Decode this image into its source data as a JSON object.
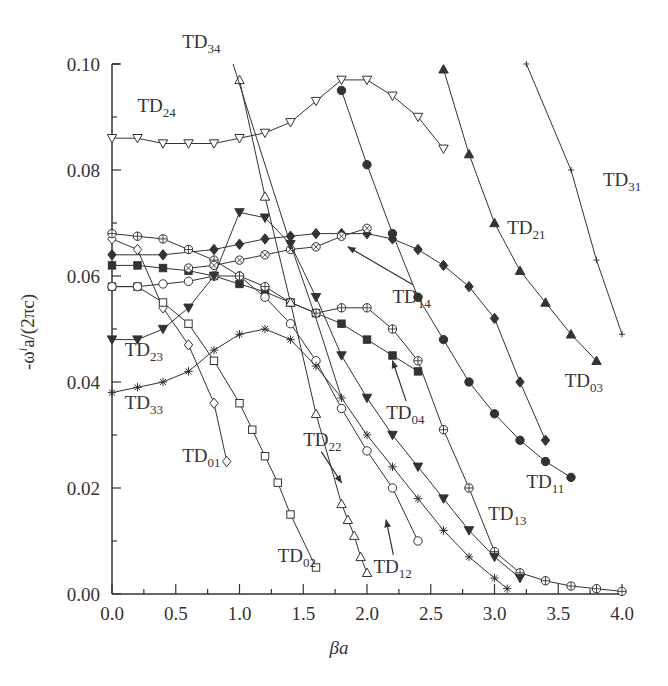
{
  "chart_data": {
    "type": "line",
    "title": "",
    "xlabel": "βa",
    "ylabel": "-ω^i a/(2πc)",
    "xlim": [
      0.0,
      4.0
    ],
    "ylim": [
      0.0,
      0.1
    ],
    "x_ticks": [
      "0.0",
      "0.5",
      "1.0",
      "1.5",
      "2.0",
      "2.5",
      "3.0",
      "3.5",
      "4.0"
    ],
    "y_ticks": [
      "0.00",
      "0.02",
      "0.04",
      "0.06",
      "0.08",
      "0.10"
    ],
    "grid": false,
    "legend": "inline labels",
    "series": [
      {
        "name": "TD01",
        "marker": "diamond-open",
        "x": [
          0.0,
          0.2,
          0.4,
          0.6,
          0.8,
          0.9
        ],
        "y": [
          0.067,
          0.065,
          0.054,
          0.047,
          0.036,
          0.025
        ]
      },
      {
        "name": "TD02",
        "marker": "square-open",
        "x": [
          0.0,
          0.2,
          0.4,
          0.6,
          0.8,
          1.0,
          1.1,
          1.2,
          1.3,
          1.4,
          1.6
        ],
        "y": [
          0.058,
          0.058,
          0.055,
          0.051,
          0.044,
          0.036,
          0.031,
          0.026,
          0.021,
          0.015,
          0.005
        ]
      },
      {
        "name": "TD03",
        "marker": "diamond-filled",
        "x": [
          0.0,
          0.4,
          0.8,
          1.0,
          1.2,
          1.4,
          1.6,
          1.8,
          2.0,
          2.2,
          2.4,
          2.6,
          2.8,
          3.0,
          3.2,
          3.4
        ],
        "y": [
          0.064,
          0.064,
          0.065,
          0.066,
          0.067,
          0.0675,
          0.068,
          0.068,
          0.068,
          0.067,
          0.065,
          0.062,
          0.058,
          0.052,
          0.04,
          0.029
        ]
      },
      {
        "name": "TD04",
        "marker": "square-filled",
        "x": [
          0.0,
          0.2,
          0.4,
          0.6,
          0.8,
          1.0,
          1.2,
          1.4,
          1.6,
          1.8,
          2.0,
          2.2,
          2.4
        ],
        "y": [
          0.062,
          0.062,
          0.0615,
          0.061,
          0.06,
          0.0585,
          0.057,
          0.055,
          0.053,
          0.051,
          0.048,
          0.045,
          0.042
        ]
      },
      {
        "name": "TD11",
        "marker": "circle-filled",
        "x": [
          1.8,
          2.0,
          2.2,
          2.4,
          2.6,
          2.8,
          3.0,
          3.2,
          3.4,
          3.6
        ],
        "y": [
          0.095,
          0.081,
          0.068,
          0.056,
          0.048,
          0.04,
          0.034,
          0.029,
          0.025,
          0.022
        ]
      },
      {
        "name": "TD12",
        "marker": "circle-open",
        "x": [
          0.0,
          0.2,
          0.4,
          0.6,
          0.8,
          1.0,
          1.2,
          1.4,
          1.6,
          1.8,
          2.0,
          2.2,
          2.4
        ],
        "y": [
          0.058,
          0.058,
          0.0585,
          0.059,
          0.06,
          0.06,
          0.056,
          0.051,
          0.044,
          0.035,
          0.027,
          0.02,
          0.01
        ]
      },
      {
        "name": "TD13",
        "marker": "circle-plus",
        "x": [
          0.0,
          0.2,
          0.4,
          0.6,
          0.8,
          1.0,
          1.2,
          1.4,
          1.6,
          1.8,
          2.0,
          2.2,
          2.4,
          2.6,
          2.8,
          3.0,
          3.2,
          3.4,
          3.6,
          3.8,
          4.0
        ],
        "y": [
          0.068,
          0.0675,
          0.067,
          0.065,
          0.063,
          0.06,
          0.058,
          0.055,
          0.053,
          0.054,
          0.054,
          0.05,
          0.044,
          0.031,
          0.02,
          0.008,
          0.004,
          0.0025,
          0.0015,
          0.001,
          0.0005
        ]
      },
      {
        "name": "TD14",
        "marker": "circle-cross",
        "x": [
          0.6,
          0.8,
          1.0,
          1.2,
          1.4,
          1.6,
          1.8,
          2.0
        ],
        "y": [
          0.0615,
          0.062,
          0.063,
          0.064,
          0.065,
          0.0655,
          0.0675,
          0.069
        ]
      },
      {
        "name": "TD21",
        "marker": "triangle-up-filled",
        "x": [
          2.6,
          2.8,
          3.0,
          3.2,
          3.4,
          3.6,
          3.8
        ],
        "y": [
          0.099,
          0.083,
          0.07,
          0.061,
          0.055,
          0.049,
          0.044
        ]
      },
      {
        "name": "TD22",
        "marker": "triangle-up-open",
        "x": [
          1.0,
          1.2,
          1.4,
          1.6,
          1.8,
          1.85,
          1.9,
          1.95,
          2.0
        ],
        "y": [
          0.097,
          0.075,
          0.055,
          0.034,
          0.017,
          0.014,
          0.011,
          0.007,
          0.004
        ]
      },
      {
        "name": "TD23",
        "marker": "triangle-down-filled",
        "x": [
          0.0,
          0.2,
          0.4,
          0.6,
          0.8,
          1.0,
          1.2,
          1.4,
          1.6,
          1.8,
          2.0,
          2.2,
          2.4,
          2.6,
          2.8,
          3.0,
          3.2
        ],
        "y": [
          0.048,
          0.048,
          0.05,
          0.054,
          0.06,
          0.072,
          0.071,
          0.066,
          0.056,
          0.045,
          0.037,
          0.03,
          0.024,
          0.018,
          0.012,
          0.007,
          0.003
        ]
      },
      {
        "name": "TD24",
        "marker": "triangle-down-open",
        "x": [
          0.0,
          0.2,
          0.4,
          0.6,
          0.8,
          1.0,
          1.2,
          1.4,
          1.6,
          1.8,
          2.0,
          2.2,
          2.4,
          2.6
        ],
        "y": [
          0.086,
          0.086,
          0.085,
          0.085,
          0.085,
          0.086,
          0.087,
          0.089,
          0.093,
          0.097,
          0.097,
          0.094,
          0.09,
          0.084
        ]
      },
      {
        "name": "TD31",
        "marker": "plus",
        "x": [
          3.25,
          3.6,
          3.8,
          4.0
        ],
        "y": [
          0.1,
          0.08,
          0.063,
          0.049
        ]
      },
      {
        "name": "TD33",
        "marker": "asterisk",
        "x": [
          0.0,
          0.2,
          0.4,
          0.6,
          0.8,
          1.0,
          1.2,
          1.4,
          1.6,
          1.8,
          2.0,
          2.2,
          2.4,
          2.6,
          2.8,
          3.0,
          3.1
        ],
        "y": [
          0.038,
          0.039,
          0.04,
          0.042,
          0.046,
          0.049,
          0.05,
          0.048,
          0.043,
          0.037,
          0.03,
          0.024,
          0.018,
          0.012,
          0.007,
          0.003,
          0.001
        ]
      },
      {
        "name": "TD34",
        "marker": "none",
        "x": [
          0.95,
          1.2,
          1.4,
          1.6,
          1.8
        ],
        "y": [
          0.1,
          0.081,
          0.066,
          0.052,
          0.037
        ]
      }
    ],
    "annotations": [
      {
        "text": "TD34",
        "label_pos": [
          0.55,
          0.103
        ]
      },
      {
        "text": "TD24",
        "label_pos": [
          0.2,
          0.091
        ]
      },
      {
        "text": "TD31",
        "label_pos": [
          3.85,
          0.077
        ]
      },
      {
        "text": "TD21",
        "label_pos": [
          3.1,
          0.068
        ]
      },
      {
        "text": "TD14",
        "label_pos": [
          2.2,
          0.055
        ],
        "arrow_to": [
          1.85,
          0.0655
        ]
      },
      {
        "text": "TD23",
        "label_pos": [
          0.1,
          0.045
        ]
      },
      {
        "text": "TD33",
        "label_pos": [
          0.1,
          0.035
        ]
      },
      {
        "text": "TD04",
        "label_pos": [
          2.15,
          0.033
        ],
        "arrow_to": [
          2.2,
          0.044
        ]
      },
      {
        "text": "TD03",
        "label_pos": [
          3.55,
          0.039
        ]
      },
      {
        "text": "TD01",
        "label_pos": [
          0.55,
          0.025
        ]
      },
      {
        "text": "TD22",
        "label_pos": [
          1.5,
          0.028
        ],
        "arrow_to": [
          1.8,
          0.021
        ]
      },
      {
        "text": "TD11",
        "label_pos": [
          3.25,
          0.02
        ]
      },
      {
        "text": "TD13",
        "label_pos": [
          2.95,
          0.014
        ]
      },
      {
        "text": "TD02",
        "label_pos": [
          1.3,
          0.006
        ]
      },
      {
        "text": "TD12",
        "label_pos": [
          2.05,
          0.004
        ],
        "arrow_to": [
          2.15,
          0.014
        ]
      }
    ]
  },
  "axes": {
    "xlabel": "βa",
    "ylabel_prefix": "-ω",
    "ylabel_sup": "i",
    "ylabel_suffix": "a/(2πc)"
  }
}
